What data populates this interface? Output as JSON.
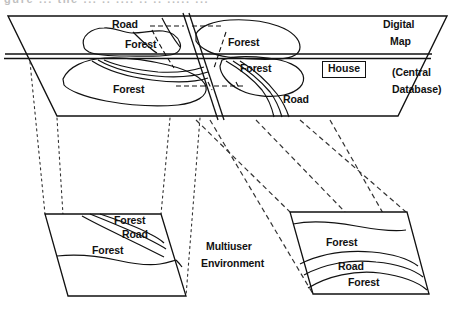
{
  "figure": {
    "cropped_caption_fragment": "gure ... the ... .. ....  .. .. ..... ...",
    "line_color": "#111111",
    "background_color": "#ffffff"
  },
  "main_plane": {
    "name": "digital-map-plane",
    "side_labels": {
      "title_line1": "Digital",
      "title_line2": "Map",
      "subtitle_line1": "(Central",
      "subtitle_line2": "Database)"
    },
    "feature_labels": [
      {
        "text": "Road",
        "x": 112,
        "y": 19
      },
      {
        "text": "Forest",
        "x": 125,
        "y": 39
      },
      {
        "text": "Forest",
        "x": 228,
        "y": 37
      },
      {
        "text": "Forest",
        "x": 240,
        "y": 63
      },
      {
        "text": "Forest",
        "x": 113,
        "y": 84
      },
      {
        "text": "Road",
        "x": 283,
        "y": 94
      }
    ],
    "house_label": "House"
  },
  "middle_label": {
    "line1": "Multiuser",
    "line2": "Environment"
  },
  "left_inset": {
    "name": "user-view-left",
    "labels": [
      {
        "text": "Forest",
        "x": 114,
        "y": 216
      },
      {
        "text": "Road",
        "x": 122,
        "y": 229
      },
      {
        "text": "Forest",
        "x": 92,
        "y": 246
      }
    ]
  },
  "right_inset": {
    "name": "user-view-right",
    "labels": [
      {
        "text": "Forest",
        "x": 326,
        "y": 238
      },
      {
        "text": "Road",
        "x": 338,
        "y": 262
      },
      {
        "text": "Forest",
        "x": 348,
        "y": 278
      }
    ]
  }
}
